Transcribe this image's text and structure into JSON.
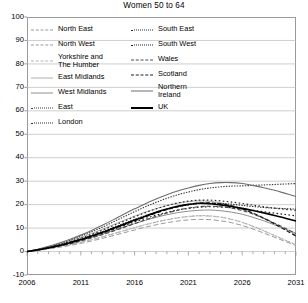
{
  "chart_data": {
    "type": "line",
    "title": "Women 50 to 64",
    "xlabel": "",
    "ylabel": "",
    "xlim": [
      2006,
      2031
    ],
    "ylim": [
      -10,
      100
    ],
    "ytick_labels": [
      "100",
      "90",
      "80",
      "70",
      "60",
      "50",
      "40",
      "30",
      "20",
      "10",
      "0",
      "-10"
    ],
    "ytick_values": [
      100,
      90,
      80,
      70,
      60,
      50,
      40,
      30,
      20,
      10,
      0,
      -10
    ],
    "xtick_labels": [
      "2006",
      "2011",
      "2016",
      "2021",
      "2026",
      "2031"
    ],
    "xtick_values": [
      2006,
      2011,
      2016,
      2021,
      2026,
      2031
    ],
    "grid": "horizontal",
    "minor_xticks": "annual",
    "legend_position": "inside-top-left",
    "x": [
      2006,
      2007,
      2008,
      2009,
      2010,
      2011,
      2012,
      2013,
      2014,
      2015,
      2016,
      2017,
      2018,
      2019,
      2020,
      2021,
      2022,
      2023,
      2024,
      2025,
      2026,
      2027,
      2028,
      2029,
      2030,
      2031
    ],
    "series": [
      {
        "name": "North East",
        "style": "fine-dash",
        "color": "#9a9a9a",
        "width": 0.9,
        "values": [
          0,
          0.6,
          1.3,
          2.1,
          3.0,
          4.0,
          5.1,
          6.3,
          7.6,
          8.9,
          10.2,
          11.5,
          12.6,
          13.6,
          14.4,
          15.0,
          15.3,
          15.2,
          14.7,
          13.8,
          12.5,
          10.8,
          8.9,
          6.9,
          4.9,
          3.0
        ]
      },
      {
        "name": "North West",
        "style": "long-dash",
        "color": "#9a9a9a",
        "width": 1.0,
        "values": [
          0,
          0.5,
          1.1,
          1.8,
          2.6,
          3.5,
          4.5,
          5.6,
          6.8,
          8.0,
          9.2,
          10.4,
          11.4,
          12.3,
          13.0,
          13.5,
          13.7,
          13.6,
          13.1,
          12.3,
          11.1,
          9.6,
          7.9,
          6.1,
          4.3,
          2.6
        ]
      },
      {
        "name": "Yorkshire and\nThe Humber",
        "style": "long-dash",
        "color": "#b5b5b5",
        "width": 1.0,
        "values": [
          0,
          0.6,
          1.2,
          2.0,
          2.9,
          3.9,
          5.0,
          6.2,
          7.5,
          8.8,
          10.1,
          11.4,
          12.5,
          13.5,
          14.3,
          14.9,
          15.2,
          15.1,
          14.6,
          13.7,
          12.4,
          10.7,
          8.8,
          6.8,
          4.8,
          2.9
        ]
      },
      {
        "name": "East Midlands",
        "style": "solid",
        "color": "#b0b0b0",
        "width": 1.0,
        "values": [
          0,
          0.9,
          1.9,
          3.1,
          4.5,
          6.0,
          7.7,
          9.5,
          11.4,
          13.3,
          15.1,
          16.8,
          18.3,
          19.6,
          20.6,
          21.3,
          21.6,
          21.4,
          20.8,
          19.7,
          18.2,
          16.3,
          14.2,
          11.9,
          9.5,
          7.2
        ]
      },
      {
        "name": "West Midlands",
        "style": "solid",
        "color": "#8f8f8f",
        "width": 1.0,
        "values": [
          0,
          0.7,
          1.5,
          2.4,
          3.5,
          4.7,
          6.0,
          7.4,
          8.9,
          10.4,
          11.9,
          13.3,
          14.6,
          15.7,
          16.6,
          17.2,
          17.6,
          17.7,
          17.4,
          16.8,
          15.9,
          14.6,
          13.1,
          11.4,
          9.6,
          7.8
        ]
      },
      {
        "name": "East",
        "style": "dotted",
        "color": "#3a3a3a",
        "width": 1.1,
        "values": [
          0,
          0.9,
          2.0,
          3.3,
          4.8,
          6.5,
          8.4,
          10.4,
          12.6,
          14.8,
          17.0,
          19.1,
          21.0,
          22.7,
          24.2,
          25.4,
          26.4,
          27.1,
          27.6,
          27.9,
          28.0,
          28.2,
          28.4,
          28.6,
          28.8,
          29.0
        ]
      },
      {
        "name": "London",
        "style": "dotted",
        "color": "#2b2b2b",
        "width": 1.1,
        "values": [
          0,
          0.8,
          1.7,
          2.8,
          4.0,
          5.4,
          6.9,
          8.5,
          10.2,
          12.0,
          13.7,
          15.3,
          16.8,
          18.1,
          19.1,
          19.9,
          20.4,
          20.6,
          20.5,
          20.2,
          19.7,
          19.2,
          18.8,
          18.5,
          18.3,
          18.1
        ]
      },
      {
        "name": "South East",
        "style": "sparse-dot",
        "color": "#2b2b2b",
        "width": 1.2,
        "values": [
          0,
          0.8,
          1.8,
          2.9,
          4.2,
          5.7,
          7.3,
          9.1,
          11.0,
          12.9,
          14.8,
          16.6,
          18.2,
          19.6,
          20.7,
          21.5,
          21.9,
          21.9,
          21.6,
          21.1,
          20.5,
          19.8,
          19.1,
          18.5,
          18.0,
          17.6
        ]
      },
      {
        "name": "South West",
        "style": "sparse-dot",
        "color": "#1f1f1f",
        "width": 1.2,
        "values": [
          0,
          0.7,
          1.5,
          2.5,
          3.6,
          4.9,
          6.3,
          7.8,
          9.4,
          11.0,
          12.6,
          14.1,
          15.5,
          16.7,
          17.7,
          18.4,
          18.9,
          19.1,
          19.0,
          18.7,
          18.2,
          17.6,
          17.0,
          16.4,
          15.8,
          15.2
        ]
      },
      {
        "name": "Wales",
        "style": "dash",
        "color": "#4a4a4a",
        "width": 1.1,
        "values": [
          0,
          0.6,
          1.4,
          2.3,
          3.3,
          4.5,
          5.8,
          7.2,
          8.7,
          10.3,
          11.9,
          13.5,
          15.0,
          16.4,
          17.6,
          18.5,
          19.1,
          19.3,
          19.1,
          18.5,
          17.5,
          16.0,
          14.2,
          12.1,
          9.9,
          7.6
        ]
      },
      {
        "name": "Scotland",
        "style": "dash",
        "color": "#1f1f1f",
        "width": 1.3,
        "values": [
          0,
          0.7,
          1.5,
          2.5,
          3.6,
          4.9,
          6.3,
          7.9,
          9.6,
          11.3,
          13.1,
          14.8,
          16.4,
          17.9,
          19.1,
          20.0,
          20.6,
          20.7,
          20.3,
          19.5,
          18.2,
          16.4,
          14.2,
          11.8,
          9.2,
          6.6
        ]
      },
      {
        "name": "Northern\nIreland",
        "style": "solid",
        "color": "#6e6e6e",
        "width": 1.1,
        "values": [
          0,
          1.0,
          2.2,
          3.6,
          5.2,
          7.0,
          9.0,
          11.2,
          13.5,
          15.9,
          18.2,
          20.4,
          22.4,
          24.2,
          25.8,
          27.1,
          28.2,
          29.0,
          29.4,
          29.4,
          29.0,
          28.2,
          27.2,
          26.1,
          24.8,
          23.5
        ]
      },
      {
        "name": "UK",
        "style": "solid",
        "color": "#000000",
        "width": 1.6,
        "values": [
          0,
          0.7,
          1.6,
          2.6,
          3.8,
          5.1,
          6.6,
          8.2,
          9.9,
          11.6,
          13.4,
          15.1,
          16.7,
          18.1,
          19.3,
          20.1,
          20.6,
          20.4,
          19.9,
          19.2,
          18.4,
          17.5,
          16.5,
          15.4,
          14.2,
          13.0
        ]
      }
    ]
  },
  "legend": {
    "left_column": [
      "North East",
      "North West",
      "Yorkshire and\nThe Humber",
      "East Midlands",
      "West Midlands",
      "East",
      "London"
    ],
    "right_column": [
      "South East",
      "South West",
      "Wales",
      "Scotland",
      "Northern\nIreland",
      "UK"
    ]
  }
}
